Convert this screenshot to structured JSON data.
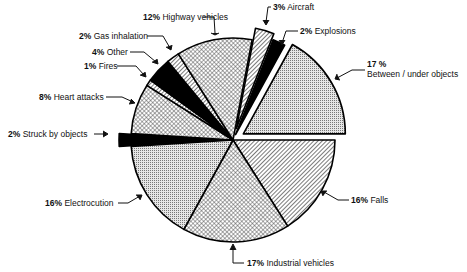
{
  "chart_data": {
    "type": "pie",
    "title": "",
    "center": [
      233,
      140
    ],
    "radius": 102,
    "start_angle_deg": 0,
    "direction": "clockwise from 3 o'clock",
    "slices": [
      {
        "label": "Falls",
        "value": 16,
        "pattern": "diag",
        "explode": 0
      },
      {
        "label": "Industrial vehicles",
        "value": 17,
        "pattern": "cross",
        "explode": 0
      },
      {
        "label": "Electrocution",
        "value": 16,
        "pattern": "dots",
        "explode": 0
      },
      {
        "label": "Struck by objects",
        "value": 2,
        "pattern": "black",
        "explode": 12
      },
      {
        "label": "Heart attacks",
        "value": 8,
        "pattern": "cross",
        "explode": 0
      },
      {
        "label": "Fires",
        "value": 1,
        "pattern": "diag",
        "explode": 0
      },
      {
        "label": "Other",
        "value": 4,
        "pattern": "black",
        "explode": 0
      },
      {
        "label": "Gas inhalation",
        "value": 2,
        "pattern": "diag",
        "explode": 0
      },
      {
        "label": "Highway vehicles",
        "value": 12,
        "pattern": "cross",
        "explode": 0
      },
      {
        "label": "Aircraft",
        "value": 3,
        "pattern": "diag",
        "explode": 12
      },
      {
        "label": "Explosions",
        "value": 2,
        "pattern": "black",
        "explode": 6
      },
      {
        "label": "Between / under objects",
        "value": 17,
        "pattern": "dots",
        "explode": 12
      }
    ]
  },
  "labels": {
    "highway": {
      "pct": "12%",
      "text": "Highway vehicles"
    },
    "aircraft": {
      "pct": "3%",
      "text": "Aircraft"
    },
    "explosions": {
      "pct": "2%",
      "text": "Explosions"
    },
    "gas": {
      "pct": "2%",
      "text": "Gas inhalation"
    },
    "other": {
      "pct": "4%",
      "text": "Other"
    },
    "fires": {
      "pct": "1%",
      "text": "Fires"
    },
    "heart": {
      "pct": "8%",
      "text": "Heart attacks"
    },
    "between": {
      "pct": "17 %",
      "text": "Between / under objects"
    },
    "struck": {
      "pct": "2%",
      "text": "Struck by objects"
    },
    "electro": {
      "pct": "16%",
      "text": "Electrocution"
    },
    "falls": {
      "pct": "16%",
      "text": "Falls"
    },
    "industrial": {
      "pct": "17%",
      "text": "Industrial vehicles"
    }
  }
}
